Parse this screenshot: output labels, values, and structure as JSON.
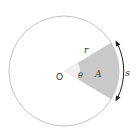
{
  "diagram": {
    "type": "circle-sector",
    "labels": {
      "center": "O",
      "radius": "r",
      "angle": "θ",
      "area": "A",
      "arc_length": "s"
    },
    "colors": {
      "circle_stroke": "#c4c4c4",
      "sector_fill": "#c9c9c9",
      "angle_wedge_fill": "#efefef",
      "text": "#333333",
      "arrow": "#222222"
    }
  }
}
